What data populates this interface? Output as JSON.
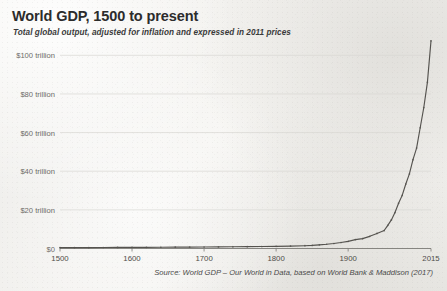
{
  "chart_data": {
    "type": "line",
    "title": "World GDP, 1500 to present",
    "subtitle": "Total global output, adjusted for inflation and expressed in 2011 prices",
    "source": "Source: World GDP – Our World in Data, based on World Bank & Maddison (2017)",
    "xlabel": "",
    "ylabel": "",
    "xlim": [
      1500,
      2015
    ],
    "ylim": [
      0,
      110
    ],
    "grid": true,
    "legend": "none",
    "y_ticks": [
      0,
      20,
      40,
      60,
      80,
      100
    ],
    "y_tick_labels": [
      "$0",
      "$20 trillion",
      "$40 trillion",
      "$60 trillion",
      "$80 trillion",
      "$100 trillion"
    ],
    "x_ticks": [
      1500,
      1600,
      1700,
      1800,
      1900,
      2015
    ],
    "x_tick_labels": [
      "1500",
      "1600",
      "1700",
      "1800",
      "1900",
      "2015"
    ],
    "units": "trillions of 2011 international dollars",
    "series": [
      {
        "name": "World GDP",
        "marker": "dot",
        "color": "#55534f",
        "x": [
          1500,
          1520,
          1540,
          1560,
          1580,
          1600,
          1620,
          1640,
          1660,
          1680,
          1700,
          1720,
          1740,
          1760,
          1780,
          1800,
          1820,
          1840,
          1850,
          1860,
          1870,
          1880,
          1890,
          1900,
          1910,
          1920,
          1930,
          1940,
          1950,
          1955,
          1960,
          1965,
          1970,
          1975,
          1980,
          1985,
          1990,
          1995,
          2000,
          2005,
          2010,
          2015
        ],
        "y": [
          0.43,
          0.46,
          0.49,
          0.52,
          0.55,
          0.58,
          0.61,
          0.64,
          0.68,
          0.72,
          0.77,
          0.82,
          0.88,
          0.95,
          1.03,
          1.13,
          1.26,
          1.45,
          1.6,
          1.9,
          2.2,
          2.6,
          3.1,
          3.7,
          4.6,
          5.1,
          6.3,
          7.8,
          9.3,
          12.0,
          14.8,
          18.6,
          23.4,
          27.5,
          33.4,
          38.6,
          46.0,
          52.0,
          62.5,
          73.0,
          86.0,
          107.5
        ]
      }
    ]
  }
}
